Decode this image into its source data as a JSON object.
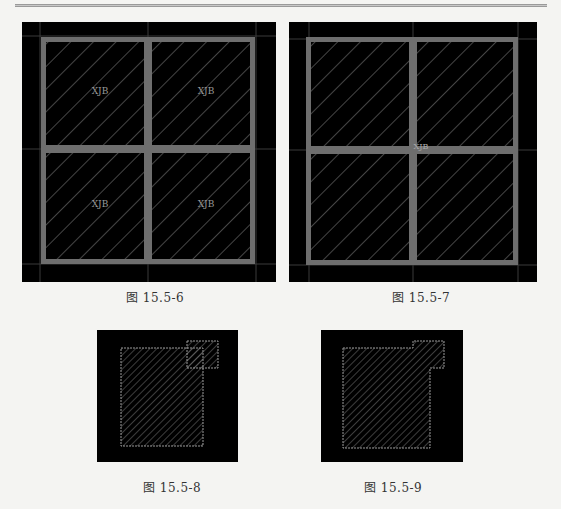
{
  "figures": [
    {
      "caption": "图 15.5-6",
      "labels": [
        "XJB",
        "XJB",
        "XJB",
        "XJB"
      ]
    },
    {
      "caption": "图 15.5-7",
      "labels": [
        "XJB"
      ]
    },
    {
      "caption": "图 15.5-8"
    },
    {
      "caption": "图 15.5-9"
    }
  ],
  "colors": {
    "background": "#000000",
    "beam": "#6e6e6e",
    "hatch": "#8a8a8a",
    "outline": "#9a9a9a",
    "gridline": "#3a3a3a"
  }
}
